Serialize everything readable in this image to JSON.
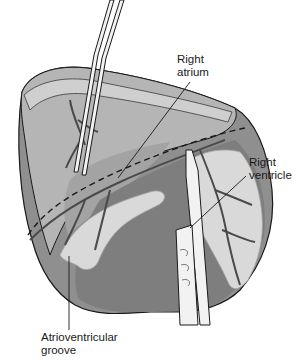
{
  "figure": {
    "type": "anatomical illustration",
    "colors": {
      "background": "#ffffff",
      "muscle": "#8f8f8f",
      "muscle_dark": "#6e6e6e",
      "fat": "#d9d9d9",
      "fat_outline": "#a8a8a8",
      "vessel": "#4a4a4a",
      "line": "#1a1a1a",
      "instrument": "#f2f2f2"
    },
    "labels": {
      "right_atrium": "Right\natrium",
      "right_ventricle": "Right\nventricle",
      "atrioventricular_groove": "Atrioventricular\ngroove"
    }
  }
}
